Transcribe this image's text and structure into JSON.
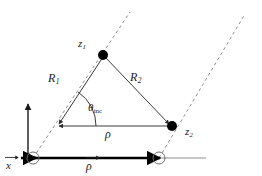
{
  "figure": {
    "type": "vector-geometry-diagram",
    "background_color": "#ffffff",
    "stroke_color": "#3a3a3a",
    "bold_stroke_color": "#000000",
    "dash_color": "#8a8a8a",
    "marker_fill": "#000000",
    "width": 262,
    "height": 176
  },
  "labels": {
    "z1": {
      "base": "z",
      "sub": "1"
    },
    "z2": {
      "base": "z",
      "sub": "2"
    },
    "R1": {
      "base": "R",
      "sub": "1"
    },
    "R2": {
      "base": "R",
      "sub": "2"
    },
    "theta_inc": {
      "base": "θ",
      "sub": "inc"
    },
    "rho": {
      "base": "ρ"
    },
    "x_vector": {
      "base": "x"
    },
    "rho_vector": {
      "base": "ρ"
    }
  },
  "geometry": {
    "apex_z1": {
      "x": 103,
      "y": 55
    },
    "vertex_left": {
      "x": 56,
      "y": 126
    },
    "point_z2": {
      "x": 172,
      "y": 126
    },
    "origin": {
      "x": 28,
      "y": 158
    },
    "circle_left": {
      "x": 33,
      "y": 158,
      "r": 6
    },
    "circle_right": {
      "x": 159,
      "y": 158,
      "r": 6
    },
    "axis_line_end": {
      "x": 206,
      "y": 158
    },
    "y_axis_top": {
      "x": 28,
      "y": 103
    },
    "dashed_left_top": {
      "x": 130,
      "y": 12
    },
    "dashed_right_top": {
      "x": 245,
      "y": 14
    },
    "angle_arc_degrees": 56,
    "angle_arc_radius": 40
  }
}
